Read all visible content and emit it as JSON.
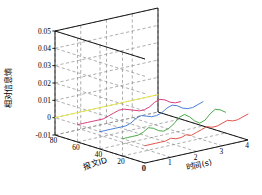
{
  "chart_data": {
    "type": "line",
    "subtype": "3d-waterfall",
    "title": "",
    "xlabel": "时间(s)",
    "ylabel": "报文ID",
    "zlabel": "相对信息熵",
    "xlim": [
      0,
      4
    ],
    "ylim": [
      0,
      80
    ],
    "zlim": [
      -0.01,
      0.05
    ],
    "xticks": [
      "0",
      "1",
      "2",
      "3",
      "4"
    ],
    "yticks": [
      "80",
      "60",
      "40",
      "20",
      "0"
    ],
    "zticks": [
      "0.05",
      "0.04",
      "0.03",
      "0.02",
      "0.01",
      "0",
      "-0.01"
    ],
    "grid": true,
    "legend": "none",
    "x": [
      0,
      0.2,
      0.4,
      0.6,
      0.8,
      1.0,
      1.2,
      1.4,
      1.6,
      1.8,
      2.0,
      2.2,
      2.4,
      2.6,
      2.8,
      3.0,
      3.2,
      3.4,
      3.6,
      3.8,
      4.0
    ],
    "series": [
      {
        "name": "报文ID 80",
        "color": "#e8e84a",
        "depth": 80,
        "values": [
          0.0,
          0.0,
          0.0,
          0.0,
          0.0,
          0.0,
          0.0,
          0.0,
          0.0,
          0.0,
          0.0,
          0.0,
          0.0,
          0.0,
          0.0,
          0.0,
          0.0,
          0.0,
          0.0,
          0.0,
          0.0
        ]
      },
      {
        "name": "报文ID 60",
        "color": "#d6407f",
        "depth": 60,
        "values": [
          0.0,
          0.0,
          0.0,
          0.0,
          0.0,
          0.0,
          0.001,
          0.002,
          0.003,
          0.003,
          0.002,
          0.001,
          0.0,
          0.0,
          0.001,
          0.003,
          0.004,
          0.003,
          0.001,
          0.0,
          0.0
        ]
      },
      {
        "name": "报文ID 40",
        "color": "#4a7fd6",
        "depth": 40,
        "values": [
          0.0,
          0.0,
          0.0,
          0.0,
          0.0,
          0.0,
          0.001,
          0.003,
          0.004,
          0.003,
          0.002,
          0.002,
          0.003,
          0.005,
          0.006,
          0.005,
          0.003,
          0.002,
          0.002,
          0.003,
          0.004
        ]
      },
      {
        "name": "报文ID 20",
        "color": "#4aa84a",
        "depth": 20,
        "values": [
          0.0,
          0.0,
          0.0,
          0.0,
          0.001,
          0.003,
          0.002,
          0.0,
          -0.001,
          0.0,
          0.002,
          0.005,
          0.006,
          0.004,
          0.001,
          -0.001,
          0.0,
          0.003,
          0.005,
          0.004,
          0.002
        ]
      },
      {
        "name": "报文ID 0",
        "color": "#e0544a",
        "depth": 0,
        "values": [
          0.0,
          0.0,
          0.0,
          0.0,
          0.0,
          0.001,
          0.0,
          0.0,
          0.001,
          0.0,
          0.001,
          0.002,
          0.003,
          0.002,
          0.002,
          0.003,
          0.004,
          0.003,
          0.003,
          0.004,
          0.005
        ]
      }
    ]
  },
  "style": {
    "axis_color": "#000000",
    "grid_color": "#8c8c8c",
    "background": "#ffffff"
  }
}
